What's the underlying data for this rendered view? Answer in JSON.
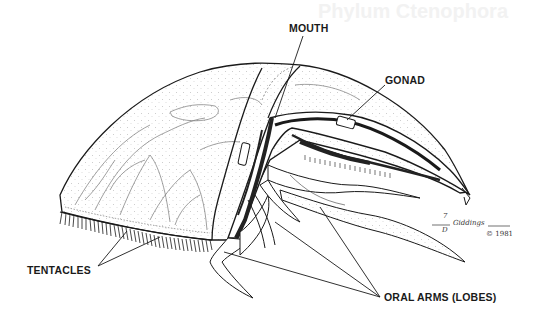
{
  "figure": {
    "labels": {
      "mouth": "MOUTH",
      "gonad": "GONAD",
      "tentacles": "TENTACLES",
      "oral_arms": "ORAL ARMS (LOBES)"
    },
    "signature": {
      "initials_top": "7",
      "initials_bottom": "D",
      "name": "Giddings",
      "copyright": "© 1981"
    },
    "bleed_through_text": "Phylum Ctenophora"
  },
  "colors": {
    "background": "#ffffff",
    "ink": "#1a1a1a",
    "stipple": "#9a9a9a",
    "dark_fill": "#222222"
  }
}
